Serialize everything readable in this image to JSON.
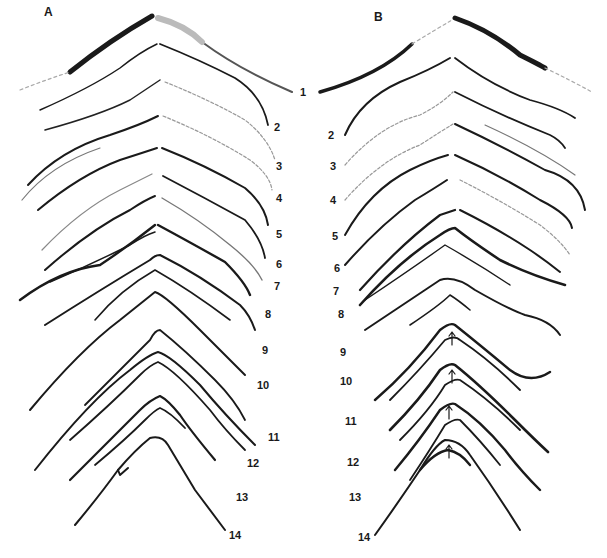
{
  "figure": {
    "panels": [
      {
        "id": "A",
        "label": "A",
        "segments": [
          "1",
          "2",
          "3",
          "4",
          "5",
          "6",
          "7",
          "8",
          "9",
          "10",
          "11",
          "12",
          "13",
          "14"
        ]
      },
      {
        "id": "B",
        "label": "B",
        "segments": [
          "1",
          "2",
          "3",
          "4",
          "5",
          "6",
          "7",
          "8",
          "9",
          "10",
          "11",
          "12",
          "13",
          "14"
        ]
      }
    ],
    "colors": {
      "ink": "#1a1a1a",
      "background": "#ffffff",
      "faint": "#9a9a9a"
    }
  }
}
